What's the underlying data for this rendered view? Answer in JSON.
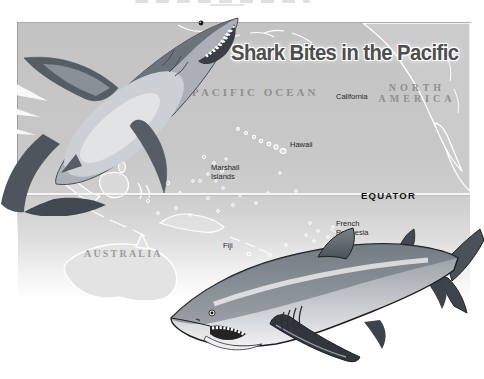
{
  "title": {
    "text": "Shark Bites in the Pacific",
    "color": "#4e4e4e",
    "outline_color": "#ffffff"
  },
  "map": {
    "ocean_label": "PACIFIC OCEAN",
    "equator_label": "EQUATOR",
    "regions": {
      "north_america": "NORTH\nAMERICA",
      "australia": "AUSTRALIA"
    },
    "places": {
      "california": "California",
      "hawaii": "Hawaii",
      "marshall_islands": "Marshall\nIslands",
      "french_polynesia": "French\nPolynesia",
      "fiji": "Fiji"
    },
    "colors": {
      "ocean": "#c7c7c7",
      "land": "#cbcbcb",
      "australia_land": "#e3e3e3",
      "island_outline": "#ffffff",
      "equator_line": "#f6f6f6",
      "region_label": "#8f8f8f",
      "place_label": "#262626"
    }
  },
  "illustrations": {
    "top_left": "diving-shark-illustration",
    "bottom_right": "swimming-shark-illustration"
  }
}
